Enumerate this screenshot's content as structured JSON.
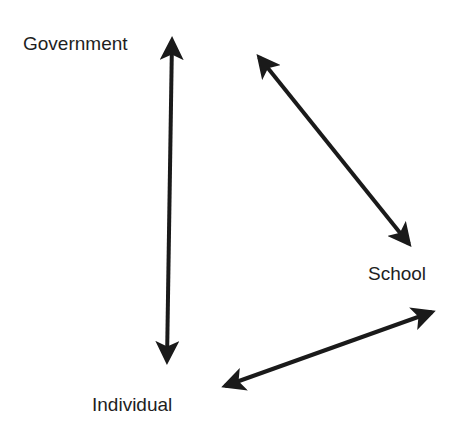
{
  "diagram": {
    "type": "relationship-triangle",
    "nodes": [
      {
        "id": "government",
        "label": "Government"
      },
      {
        "id": "school",
        "label": "School"
      },
      {
        "id": "individual",
        "label": "Individual"
      }
    ],
    "edges": [
      {
        "from": "government",
        "to": "individual",
        "direction": "bidirectional"
      },
      {
        "from": "government",
        "to": "school",
        "direction": "bidirectional"
      },
      {
        "from": "school",
        "to": "individual",
        "direction": "bidirectional"
      }
    ],
    "colors": {
      "arrow": "#1a1a1a",
      "text": "#1e1e1e",
      "background": "#ffffff"
    }
  }
}
